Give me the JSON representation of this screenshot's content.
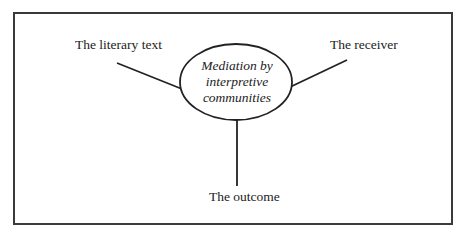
{
  "diagram": {
    "center": {
      "lines": [
        "Mediation by",
        "interpretive",
        "communities"
      ]
    },
    "nodes": {
      "top_left": "The literary text",
      "top_right": "The receiver",
      "bottom": "The outcome"
    }
  }
}
